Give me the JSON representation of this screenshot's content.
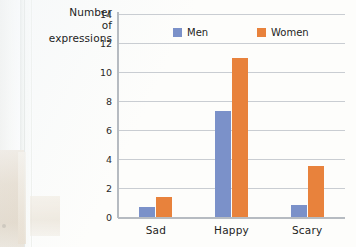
{
  "chart_data": {
    "type": "bar",
    "title": "",
    "subtitle": "",
    "ylabel": "Number of expressions",
    "ylabel_lines": [
      "Number",
      "of",
      "expressions"
    ],
    "xlabel": "",
    "categories": [
      "Sad",
      "Happy",
      "Scary"
    ],
    "series": [
      {
        "name": "Men",
        "color": "#7b91c9",
        "values": [
          0.7,
          7.3,
          0.8
        ]
      },
      {
        "name": "Women",
        "color": "#e8823c",
        "values": [
          1.35,
          11.0,
          3.5
        ]
      }
    ],
    "ylim": [
      0,
      14
    ],
    "ytick_values": [
      0,
      2,
      4,
      6,
      8,
      10,
      12,
      14
    ],
    "ytick_labels": [
      "0",
      "2",
      "4",
      "6",
      "8",
      "10",
      "12",
      "14"
    ],
    "grid": "horizontal",
    "legend_position": "top-center",
    "gridline_color": "#c9cdd2",
    "axis_color": "#b6bbc1"
  },
  "legend": {
    "items": [
      {
        "label": "Men",
        "swatch_name": "legend-swatch-men"
      },
      {
        "label": "Women",
        "swatch_name": "legend-swatch-women"
      }
    ]
  }
}
